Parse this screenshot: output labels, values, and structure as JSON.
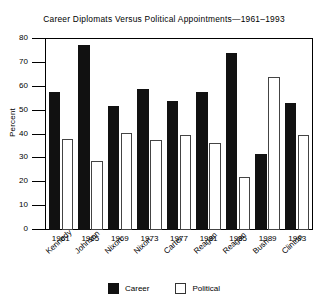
{
  "chart_data": {
    "type": "bar",
    "title": "Career Diplomats Versus Political Appointments—1961–1993",
    "xlabel": "",
    "ylabel": "Percent",
    "ylim": [
      0,
      80
    ],
    "yticks": [
      0,
      10,
      20,
      30,
      40,
      50,
      60,
      70,
      80
    ],
    "grid": false,
    "legend_position": "bottom-center",
    "categories": [
      "1961",
      "1965",
      "1969",
      "1973",
      "1977",
      "1981",
      "1985",
      "1989",
      "1993"
    ],
    "category_sublabels": [
      "Kennedy",
      "Johnson",
      "Nixon",
      "Nixon",
      "Carter",
      "Reagan",
      "Reagan",
      "Bush",
      "Clinton"
    ],
    "series": [
      {
        "name": "Career",
        "color": "#111111",
        "values": [
          58,
          77.5,
          52,
          59,
          54,
          58,
          74,
          32,
          53
        ]
      },
      {
        "name": "Political",
        "color": "#ffffff",
        "values": [
          38,
          29,
          40.5,
          37.5,
          40,
          36.5,
          22,
          64,
          40
        ]
      }
    ]
  },
  "legend": {
    "items": [
      {
        "label": "Career",
        "swatch": "filled-square-icon"
      },
      {
        "label": "Political",
        "swatch": "outline-square-icon"
      }
    ]
  }
}
